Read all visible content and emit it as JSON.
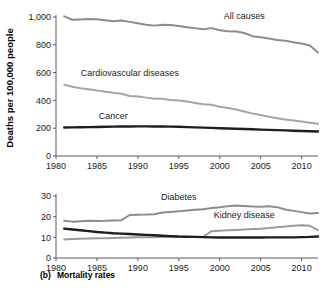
{
  "figure": {
    "caption_prefix": "(b)",
    "caption_text": "Mortality rates",
    "ylabel": "Deaths per 100,000 people"
  },
  "chart_data": [
    {
      "type": "line",
      "panel": "top",
      "title": "",
      "xlabel": "",
      "ylabel": "Deaths per 100,000 people",
      "xlim": [
        1980,
        2012
      ],
      "ylim": [
        0,
        1000
      ],
      "xticks": [
        1980,
        1985,
        1990,
        1995,
        2000,
        2005,
        2010
      ],
      "xticklabels": [
        "1980",
        "1985",
        "1990",
        "1995",
        "2000",
        "2005",
        "2010"
      ],
      "yticks": [
        0,
        200,
        400,
        600,
        800,
        1000
      ],
      "yticklabels": [
        "0",
        "200",
        "400",
        "600",
        "800",
        "1,000"
      ],
      "grid": false,
      "legend": "inline-labels",
      "x": [
        1981,
        1982,
        1983,
        1984,
        1985,
        1986,
        1987,
        1988,
        1989,
        1990,
        1991,
        1992,
        1993,
        1994,
        1995,
        1996,
        1997,
        1998,
        1999,
        2000,
        2001,
        2002,
        2003,
        2004,
        2005,
        2006,
        2007,
        2008,
        2009,
        2010,
        2011,
        2012
      ],
      "series": [
        {
          "name": "All causes",
          "color": "#8c8c8c",
          "label_x": 2003,
          "label_y": 985,
          "values": [
            1005,
            980,
            982,
            985,
            983,
            977,
            970,
            975,
            965,
            955,
            945,
            938,
            945,
            942,
            935,
            927,
            920,
            912,
            920,
            905,
            898,
            895,
            885,
            862,
            855,
            845,
            835,
            830,
            818,
            810,
            795,
            745
          ]
        },
        {
          "name": "Cardiovascular diseases",
          "color": "#a5a5a5",
          "label_x": 1989,
          "label_y": 575,
          "values": [
            512,
            498,
            488,
            480,
            472,
            462,
            455,
            448,
            432,
            428,
            420,
            412,
            412,
            402,
            400,
            392,
            382,
            372,
            368,
            355,
            345,
            335,
            320,
            305,
            295,
            283,
            272,
            262,
            255,
            248,
            240,
            232
          ]
        },
        {
          "name": "Cancer",
          "color": "#1e1e1e",
          "label_x": 1987,
          "label_y": 268,
          "values": [
            205,
            206,
            207,
            208,
            209,
            210,
            211,
            212,
            212,
            213,
            213,
            212,
            212,
            211,
            210,
            208,
            206,
            204,
            202,
            200,
            198,
            196,
            194,
            192,
            190,
            188,
            186,
            184,
            182,
            180,
            178,
            176
          ]
        }
      ]
    },
    {
      "type": "line",
      "panel": "bottom",
      "title": "",
      "xlabel": "",
      "ylabel": "",
      "xlim": [
        1980,
        2012
      ],
      "ylim": [
        0,
        30
      ],
      "xticks": [
        1980,
        1985,
        1990,
        1995,
        2000,
        2005,
        2010
      ],
      "xticklabels": [
        "1980",
        "1985",
        "1990",
        "1995",
        "2000",
        "2005",
        "2010"
      ],
      "yticks": [
        0,
        10,
        20,
        30
      ],
      "yticklabels": [
        "0",
        "10",
        "20",
        "30"
      ],
      "grid": false,
      "legend": "inline-labels",
      "x": [
        1981,
        1982,
        1983,
        1984,
        1985,
        1986,
        1987,
        1988,
        1989,
        1990,
        1991,
        1992,
        1993,
        1994,
        1995,
        1996,
        1997,
        1998,
        1999,
        2000,
        2001,
        2002,
        2003,
        2004,
        2005,
        2006,
        2007,
        2008,
        2009,
        2010,
        2011,
        2012
      ],
      "series": [
        {
          "name": "Diabetes",
          "color": "#8c8c8c",
          "label_x": 1995,
          "label_y": 28,
          "values": [
            18.0,
            17.6,
            17.8,
            18.0,
            17.9,
            18.0,
            18.2,
            18.3,
            20.8,
            20.9,
            21.0,
            21.2,
            22.0,
            22.3,
            22.6,
            23.0,
            23.3,
            23.6,
            24.2,
            24.6,
            25.1,
            25.4,
            25.2,
            24.9,
            24.8,
            25.0,
            24.6,
            23.5,
            22.8,
            22.2,
            21.5,
            21.8
          ]
        },
        {
          "name": "Kidney disease",
          "color": "#9a9a9a",
          "label_x": 2003,
          "label_y": 19.5,
          "values": [
            9.0,
            9.2,
            9.3,
            9.4,
            9.5,
            9.6,
            9.7,
            9.8,
            9.9,
            10.0,
            10.0,
            10.1,
            10.2,
            10.2,
            10.2,
            10.2,
            10.2,
            10.3,
            13.0,
            13.2,
            13.4,
            13.6,
            13.8,
            14.0,
            14.2,
            14.5,
            14.9,
            15.2,
            15.6,
            15.8,
            15.6,
            13.5
          ]
        },
        {
          "name": "Chronic lower respiratory diseases",
          "color": "#1e1e1e",
          "label_x": null,
          "label_y": null,
          "values": [
            14.2,
            13.8,
            13.4,
            13.0,
            12.6,
            12.3,
            12.0,
            11.8,
            11.6,
            11.4,
            11.2,
            11.0,
            10.8,
            10.6,
            10.4,
            10.3,
            10.2,
            10.1,
            10.0,
            9.9,
            9.9,
            9.9,
            9.9,
            9.9,
            9.9,
            10.0,
            10.0,
            10.0,
            10.0,
            10.1,
            10.2,
            10.4
          ]
        }
      ]
    }
  ]
}
